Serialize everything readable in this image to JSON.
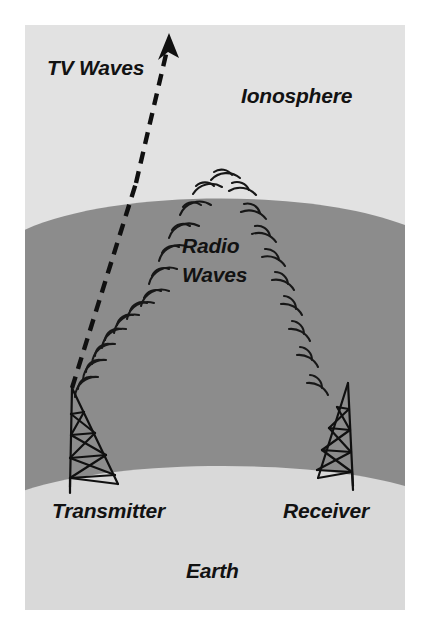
{
  "figure": {
    "canvas": {
      "width": 423,
      "height": 628
    },
    "plate": {
      "x": 25,
      "y": 25,
      "width": 380,
      "height": 585
    }
  },
  "labels": {
    "tv_waves": "TV Waves",
    "ionosphere": "Ionosphere",
    "radio_line1": "Radio",
    "radio_line2": "Waves",
    "transmitter": "Transmitter",
    "receiver": "Receiver",
    "earth": "Earth"
  },
  "regions": [
    {
      "name": "ionosphere",
      "label": "Ionosphere",
      "color": "#e2e2e2"
    },
    {
      "name": "atmosphere",
      "label": "",
      "color": "#8c8c8c"
    },
    {
      "name": "earth",
      "label": "Earth",
      "color": "#d9d9d9"
    }
  ],
  "colors": {
    "ionosphere_fill": "#e2e2e2",
    "atmosphere_fill": "#8c8c8c",
    "earth_fill": "#d9d9d9",
    "ink": "#101010",
    "page_background": "#ffffff"
  },
  "structures": [
    {
      "name": "transmitter-tower",
      "label": "Transmitter",
      "base_x": 95,
      "base_y": 480
    },
    {
      "name": "receiver-tower",
      "label": "Receiver",
      "base_x": 340,
      "base_y": 478
    }
  ],
  "paths": {
    "tv_waves": {
      "name": "tv-wave-path",
      "style": "dashed",
      "points": [
        [
          72,
          386
        ],
        [
          136,
          183
        ],
        [
          168,
          42
        ]
      ],
      "arrow_at": [
        168,
        36
      ]
    },
    "radio_waves": {
      "name": "radio-wave-arc-path",
      "style": "concentric-arc-pairs",
      "arc_count": 22,
      "from": "transmitter",
      "to": "receiver"
    }
  }
}
